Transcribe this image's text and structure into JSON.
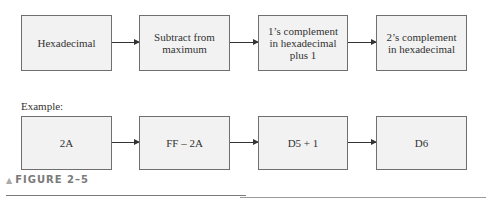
{
  "diagram": {
    "flow": [
      {
        "label": "Hexadecimal"
      },
      {
        "label": "Subtract from maximum"
      },
      {
        "label": "1’s complement in hexadecimal plus 1"
      },
      {
        "label": "2’s complement in hexadecimal"
      }
    ],
    "example_label": "Example:",
    "example": [
      {
        "label": "2A"
      },
      {
        "label": "FF – 2A"
      },
      {
        "label": "D5 + 1"
      },
      {
        "label": "D6"
      }
    ]
  },
  "caption": {
    "marker": "▲",
    "text": "FIGURE 2–5"
  }
}
